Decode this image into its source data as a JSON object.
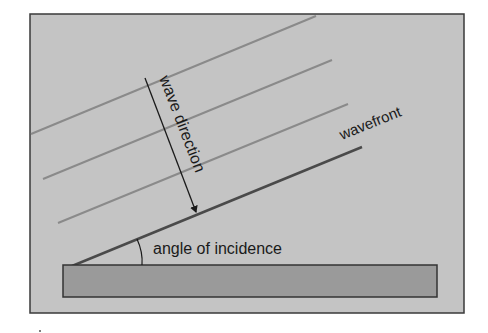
{
  "diagram": {
    "labels": {
      "wave_direction": "wave direction",
      "wavefront": "wavefront",
      "angle": "angle of incidence"
    },
    "colors": {
      "background": "#c4c4c4",
      "frame": "#3a3a3a",
      "crest_lines": "#8a8a8a",
      "wavefront_line": "#4a4a4a",
      "shore_fill": "#9a9a9a",
      "shore_stroke": "#333333",
      "arrow": "#1a1a1a"
    },
    "crest_line_count": 3
  }
}
